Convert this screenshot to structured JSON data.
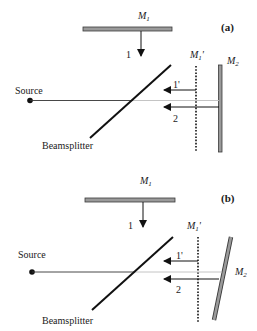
{
  "diagram": {
    "type": "Michelson interferometer schematic",
    "panels": [
      {
        "id": "a",
        "panel_label": "(a)",
        "mirror1_label": "M",
        "mirror1_sub": "1",
        "mirror1_image_label": "M",
        "mirror1_image_sub": "1",
        "mirror1_image_prime": "'",
        "mirror2_label": "M",
        "mirror2_sub": "2",
        "source_label": "Source",
        "beamsplitter_label": "Beamsplitter",
        "beam1_label": "1",
        "beam1prime_label": "1'",
        "beam2_label": "2",
        "mirror2_orientation": "perpendicular"
      },
      {
        "id": "b",
        "panel_label": "(b)",
        "mirror1_label": "M",
        "mirror1_sub": "1",
        "mirror1_image_label": "M",
        "mirror1_image_sub": "1",
        "mirror1_image_prime": "'",
        "mirror2_label": "M",
        "mirror2_sub": "2",
        "source_label": "Source",
        "beamsplitter_label": "Beamsplitter",
        "beam1_label": "1",
        "beam1prime_label": "1'",
        "beam2_label": "2",
        "mirror2_orientation": "tilted"
      }
    ],
    "colors": {
      "mirror_fill": "#9a9a9a",
      "mirror_stroke": "#3a3a3a",
      "line": "#111111",
      "beam_light": "#bdbdbd"
    }
  }
}
